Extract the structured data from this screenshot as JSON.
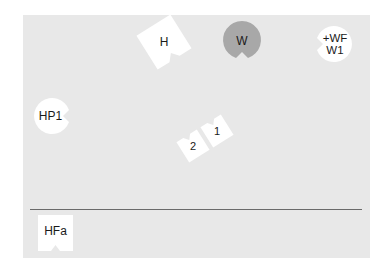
{
  "diagram": {
    "background_color": "#e8e8e8",
    "piece_color": "#ffffff",
    "highlight_color": "#a8a8a8",
    "divider_color": "#6a6a6a",
    "pieces": [
      {
        "id": "H",
        "label": "H",
        "shape": "square-notched",
        "fill": "#ffffff",
        "rotation_deg": -32
      },
      {
        "id": "W",
        "label": "W",
        "shape": "circle-notched",
        "fill": "#a8a8a8",
        "notch": "bottom"
      },
      {
        "id": "WF-W1",
        "label": "+WF\nW1",
        "shape": "circle-notched",
        "fill": "#ffffff",
        "notch": "left"
      },
      {
        "id": "HP1",
        "label": "HP1",
        "shape": "circle-notched",
        "fill": "#ffffff",
        "notch": "right"
      },
      {
        "id": "1",
        "label": "1",
        "shape": "square-notched",
        "fill": "#ffffff",
        "rotation_deg": -32
      },
      {
        "id": "2",
        "label": "2",
        "shape": "square-notched",
        "fill": "#ffffff",
        "rotation_deg": -32
      },
      {
        "id": "HFa",
        "label": "HFa",
        "shape": "square-notched",
        "fill": "#ffffff",
        "rotation_deg": 0
      }
    ]
  }
}
